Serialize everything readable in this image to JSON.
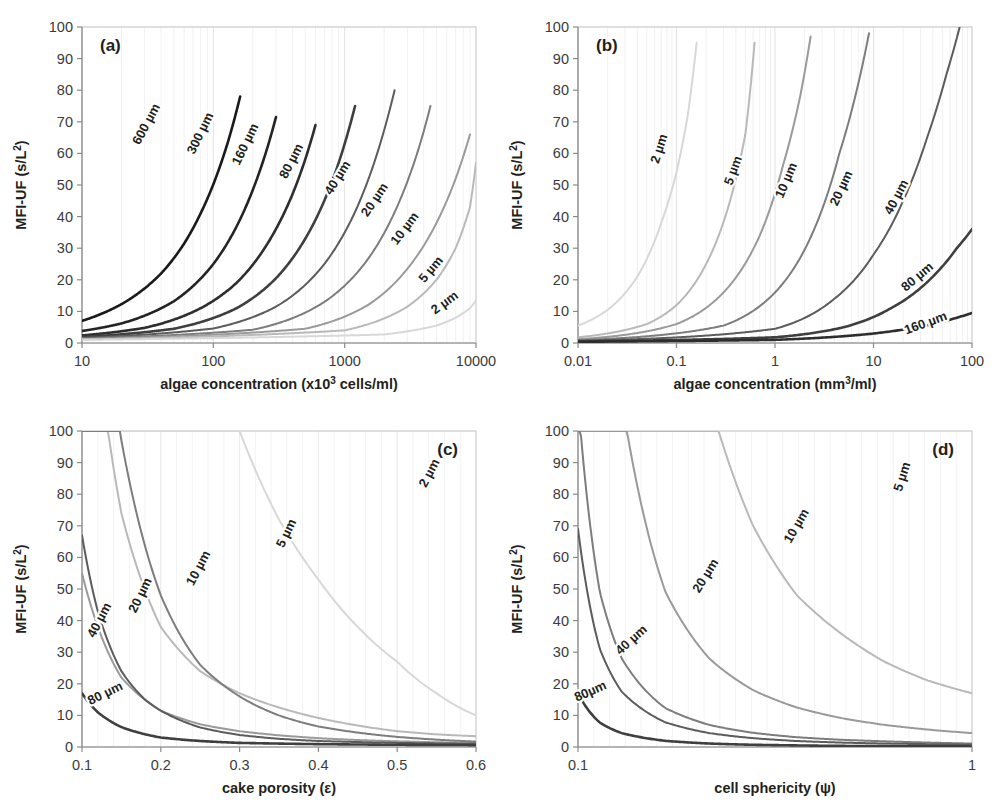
{
  "figure": {
    "background": "#ffffff",
    "panel_count": 4,
    "shared_ylabel": "MFI-UF (s/L²)",
    "shared_ylim": [
      0,
      100
    ],
    "shared_yticks": [
      0,
      10,
      20,
      30,
      40,
      50,
      60,
      70,
      80,
      90,
      100
    ],
    "curve_palette": {
      "600": "#1a1a1a",
      "300": "#242424",
      "160": "#2e2e2e",
      "80": "#3f3f3f",
      "40": "#5c5c5c",
      "20": "#7d7d7d",
      "10": "#9a9a9a",
      "5": "#b9b9b9",
      "2": "#d8d8d8"
    },
    "frame_color": "#b5b5b5",
    "gridline_color": "#ebebeb"
  },
  "chart_data": [
    {
      "type": "line",
      "panel": "a",
      "tag": "(a)",
      "tag_position": "top-left",
      "title": "",
      "xlabel": "algae concentration (x10³ cells/ml)",
      "xlabel_parts": {
        "pre": "algae concentration  (x10",
        "sup": "3",
        "post": " cells/ml)"
      },
      "ylabel": "MFI-UF (s/L²)",
      "xscale": "log",
      "xlim": [
        10,
        10000
      ],
      "ylim": [
        0,
        100
      ],
      "xticks": [
        10,
        100,
        1000,
        10000
      ],
      "xticklabels": [
        "10",
        "100",
        "1000",
        "10000"
      ],
      "yticks": [
        0,
        10,
        20,
        30,
        40,
        50,
        60,
        70,
        80,
        90,
        100
      ],
      "grid": "minor-vertical-log",
      "legend": "inline-curve-labels",
      "series": [
        {
          "name": "600 µm",
          "label": "600 µm",
          "color": "#1a1a1a",
          "x": [
            10,
            20,
            40,
            60,
            80,
            100,
            130,
            160
          ],
          "values": [
            7.0,
            12.3,
            22.0,
            31.5,
            41.0,
            50.2,
            64.0,
            78.0
          ]
        },
        {
          "name": "300 µm",
          "label": "300 µm",
          "color": "#242424",
          "x": [
            10,
            20,
            50,
            100,
            150,
            200,
            250,
            300
          ],
          "values": [
            3.8,
            6.2,
            13.2,
            25.0,
            36.8,
            48.5,
            60.0,
            71.5
          ]
        },
        {
          "name": "160 µm",
          "label": "160 µm",
          "color": "#2e2e2e",
          "x": [
            10,
            30,
            80,
            150,
            250,
            400,
            500,
            600
          ],
          "values": [
            2.4,
            4.8,
            11.0,
            19.0,
            30.5,
            47.0,
            58.0,
            69.0
          ]
        },
        {
          "name": "80 µm",
          "label": "80 µm",
          "color": "#3f3f3f",
          "x": [
            10,
            50,
            150,
            300,
            600,
            900,
            1200
          ],
          "values": [
            1.9,
            4.5,
            11.0,
            20.5,
            39.0,
            57.0,
            75.0
          ]
        },
        {
          "name": "40 µm",
          "label": "40 µm",
          "color": "#5c5c5c",
          "x": [
            10,
            100,
            300,
            700,
            1200,
            1800,
            2400
          ],
          "values": [
            1.6,
            4.6,
            11.5,
            25.0,
            41.5,
            61.0,
            80.0
          ]
        },
        {
          "name": "20 µm",
          "label": "20 µm",
          "color": "#7d7d7d",
          "x": [
            10,
            200,
            700,
            1500,
            2500,
            3500,
            4500
          ],
          "values": [
            1.4,
            4.2,
            13.0,
            26.5,
            43.0,
            59.0,
            75.0
          ]
        },
        {
          "name": "10 µm",
          "label": "10 µm",
          "color": "#9a9a9a",
          "x": [
            10,
            500,
            1500,
            3000,
            5000,
            7000,
            9000
          ],
          "values": [
            1.2,
            4.5,
            12.0,
            23.5,
            38.0,
            52.0,
            66.0
          ]
        },
        {
          "name": "5 µm",
          "label": "5 µm",
          "color": "#b9b9b9",
          "x": [
            10,
            1000,
            3000,
            5000,
            7000,
            9000,
            10000
          ],
          "values": [
            1.1,
            4.0,
            11.5,
            20.0,
            30.0,
            43.0,
            57.0
          ]
        },
        {
          "name": "2 µm",
          "label": "2 µm",
          "color": "#d8d8d8",
          "x": [
            10,
            2000,
            5000,
            7000,
            9000,
            10000
          ],
          "values": [
            1.0,
            2.7,
            5.5,
            8.0,
            11.0,
            13.5
          ]
        }
      ]
    },
    {
      "type": "line",
      "panel": "b",
      "tag": "(b)",
      "tag_position": "top-left",
      "title": "",
      "xlabel": "algae concentration (mm³/ml)",
      "xlabel_parts": {
        "pre": "algae concentration  (mm",
        "sup": "3",
        "post": "/ml)"
      },
      "ylabel": "MFI-UF (s/L²)",
      "xscale": "log",
      "xlim": [
        0.01,
        100
      ],
      "ylim": [
        0,
        100
      ],
      "xticks": [
        0.01,
        0.1,
        1,
        10,
        100
      ],
      "xticklabels": [
        "0.01",
        "0.1",
        "1",
        "10",
        "100"
      ],
      "yticks": [
        0,
        10,
        20,
        30,
        40,
        50,
        60,
        70,
        80,
        90,
        100
      ],
      "grid": "minor-vertical-log",
      "legend": "inline-curve-labels",
      "series": [
        {
          "name": "2 µm",
          "label": "2 µm",
          "color": "#d8d8d8",
          "x": [
            0.01,
            0.02,
            0.04,
            0.07,
            0.1,
            0.13,
            0.16
          ],
          "values": [
            5.5,
            10.5,
            21.0,
            38.0,
            54.0,
            72.0,
            95.0
          ]
        },
        {
          "name": "5 µm",
          "label": "5 µm",
          "color": "#b9b9b9",
          "x": [
            0.01,
            0.05,
            0.1,
            0.2,
            0.35,
            0.5,
            0.62
          ],
          "values": [
            1.8,
            6.0,
            12.0,
            25.0,
            45.0,
            66.0,
            95.0
          ]
        },
        {
          "name": "10 µm",
          "label": "10 µm",
          "color": "#9a9a9a",
          "x": [
            0.01,
            0.1,
            0.3,
            0.7,
            1.2,
            1.8,
            2.3
          ],
          "values": [
            1.2,
            6.0,
            16.0,
            34.0,
            56.0,
            78.0,
            97.0
          ]
        },
        {
          "name": "20 µm",
          "label": "20 µm",
          "color": "#7d7d7d",
          "x": [
            0.01,
            0.3,
            1.0,
            2.5,
            4.5,
            7.0,
            9.0
          ],
          "values": [
            0.9,
            5.5,
            16.0,
            36.0,
            60.0,
            82.0,
            98.0
          ]
        },
        {
          "name": "40 µm",
          "label": "40 µm",
          "color": "#5c5c5c",
          "x": [
            0.01,
            1.0,
            4.0,
            10.0,
            20.0,
            35.0,
            55.0,
            75.0
          ],
          "values": [
            0.7,
            4.5,
            14.0,
            28.0,
            45.0,
            65.0,
            85.0,
            100.0
          ]
        },
        {
          "name": "80 µm",
          "label": "80 µm",
          "color": "#3f3f3f",
          "x": [
            0.01,
            1.0,
            5.0,
            15.0,
            40.0,
            70.0,
            100.0
          ],
          "values": [
            0.5,
            1.8,
            5.0,
            11.0,
            21.0,
            30.0,
            36.0
          ]
        },
        {
          "name": "160 µm",
          "label": "160 µm",
          "color": "#2e2e2e",
          "x": [
            0.01,
            1.0,
            10.0,
            40.0,
            70.0,
            100.0
          ],
          "values": [
            0.4,
            1.0,
            3.0,
            6.0,
            8.0,
            9.5
          ]
        }
      ]
    },
    {
      "type": "line",
      "panel": "c",
      "tag": "(c)",
      "tag_position": "top-right",
      "title": "",
      "xlabel": "cake porosity (ε)",
      "ylabel": "MFI-UF (s/L²)",
      "xscale": "linear",
      "xlim": [
        0.1,
        0.6
      ],
      "ylim": [
        0,
        100
      ],
      "xticks": [
        0.1,
        0.2,
        0.3,
        0.4,
        0.5,
        0.6
      ],
      "xticklabels": [
        "0.1",
        "0.2",
        "0.3",
        "0.4",
        "0.5",
        "0.6"
      ],
      "yticks": [
        0,
        10,
        20,
        30,
        40,
        50,
        60,
        70,
        80,
        90,
        100
      ],
      "grid": "minor-vertical",
      "legend": "inline-curve-labels",
      "series": [
        {
          "name": "2 µm",
          "label": "2 µm",
          "color": "#d8d8d8",
          "x": [
            0.1,
            0.15,
            0.2,
            0.25,
            0.3,
            0.35,
            0.4,
            0.45,
            0.5,
            0.55,
            0.6
          ],
          "values": [
            1100,
            430,
            215,
            145,
            100,
            72,
            53,
            38,
            27,
            17,
            10
          ]
        },
        {
          "name": "5 µm",
          "label": "5 µm",
          "color": "#b9b9b9",
          "x": [
            0.1,
            0.15,
            0.2,
            0.25,
            0.3,
            0.35,
            0.4,
            0.45,
            0.5,
            0.55,
            0.6
          ],
          "values": [
            180,
            74,
            38,
            24,
            17,
            12.5,
            9.2,
            6.8,
            5.0,
            4.0,
            3.4
          ]
        },
        {
          "name": "10 µm",
          "label": "10 µm",
          "color": "#9a9a9a",
          "x": [
            0.1,
            0.15,
            0.2,
            0.25,
            0.3,
            0.35,
            0.4,
            0.45,
            0.5,
            0.55,
            0.6
          ],
          "values": [
            55,
            22,
            11.5,
            7.2,
            5.0,
            3.7,
            2.8,
            2.2,
            1.8,
            1.5,
            1.3
          ]
        },
        {
          "name": "20 µm",
          "label": "20 µm",
          "color": "#7d7d7d",
          "x": [
            0.1,
            0.12,
            0.15,
            0.2,
            0.25,
            0.3,
            0.35,
            0.4,
            0.5,
            0.6
          ],
          "values": [
            270,
            175,
            97,
            48,
            26,
            16,
            10,
            6.5,
            3.2,
            1.7
          ]
        },
        {
          "name": "40 µm",
          "label": "40 µm",
          "color": "#5c5c5c",
          "x": [
            0.1,
            0.12,
            0.15,
            0.18,
            0.2,
            0.25,
            0.3,
            0.35,
            0.4,
            0.5,
            0.6
          ],
          "values": [
            67,
            43,
            24,
            15,
            11.5,
            6.2,
            3.8,
            2.6,
            1.9,
            1.3,
            1.0
          ]
        },
        {
          "name": "80 µm",
          "label": "80 µm",
          "color": "#3f3f3f",
          "x": [
            0.1,
            0.12,
            0.15,
            0.2,
            0.25,
            0.3,
            0.4,
            0.5,
            0.6
          ],
          "values": [
            17,
            11,
            6.3,
            3.0,
            1.9,
            1.3,
            0.9,
            0.7,
            0.6
          ]
        }
      ]
    },
    {
      "type": "line",
      "panel": "d",
      "tag": "(d)",
      "tag_position": "top-right",
      "title": "",
      "xlabel": "cell sphericity (ψ)",
      "ylabel": "MFI-UF (s/L²)",
      "xscale": "linear",
      "xlim": [
        0.1,
        1
      ],
      "ylim": [
        0,
        100
      ],
      "xticks": [
        0.1,
        1
      ],
      "xticklabels": [
        "0.1",
        "1"
      ],
      "yticks": [
        0,
        10,
        20,
        30,
        40,
        50,
        60,
        70,
        80,
        90,
        100
      ],
      "grid": "minor-vertical",
      "legend": "inline-curve-labels",
      "series": [
        {
          "name": "5 µm",
          "label": "5 µm",
          "color": "#b9b9b9",
          "x": [
            0.1,
            0.2,
            0.3,
            0.4,
            0.5,
            0.6,
            0.7,
            0.8,
            0.9,
            1.0
          ],
          "values": [
            1750,
            430,
            195,
            110,
            70,
            48,
            36,
            27,
            21,
            17
          ]
        },
        {
          "name": "10 µm",
          "label": "10 µm",
          "color": "#9a9a9a",
          "x": [
            0.1,
            0.2,
            0.3,
            0.4,
            0.5,
            0.6,
            0.7,
            0.8,
            0.9,
            1.0
          ],
          "values": [
            440,
            110,
            49,
            28,
            18,
            12.5,
            9.2,
            7.0,
            5.5,
            4.4
          ]
        },
        {
          "name": "20 µm",
          "label": "20 µm",
          "color": "#7d7d7d",
          "x": [
            0.1,
            0.15,
            0.2,
            0.3,
            0.4,
            0.5,
            0.6,
            0.7,
            0.8,
            0.9,
            1.0
          ],
          "values": [
            110,
            49,
            28,
            12.3,
            7.0,
            4.5,
            3.1,
            2.3,
            1.8,
            1.4,
            1.1
          ]
        },
        {
          "name": "40 µm",
          "label": "40 µm",
          "color": "#5c5c5c",
          "x": [
            0.1,
            0.15,
            0.2,
            0.3,
            0.4,
            0.5,
            0.6,
            0.7,
            0.8,
            0.9,
            1.0
          ],
          "values": [
            69,
            31,
            17.5,
            7.8,
            4.4,
            2.8,
            1.9,
            1.4,
            1.1,
            0.9,
            0.7
          ]
        },
        {
          "name": "80 µm",
          "label": "80 µm",
          "color": "#3f3f3f",
          "x": [
            0.1,
            0.15,
            0.2,
            0.3,
            0.4,
            0.5,
            0.6,
            0.7,
            0.8,
            0.9,
            1.0
          ],
          "values": [
            17,
            7.7,
            4.4,
            1.95,
            1.1,
            0.7,
            0.5,
            0.35,
            0.27,
            0.22,
            0.18
          ]
        }
      ]
    }
  ],
  "labels": {
    "panel_a": {
      "curve_label_positions": [
        {
          "text": "600 µm",
          "x": 150,
          "y": 126,
          "rot": -62
        },
        {
          "text": "300 µm",
          "x": 204,
          "y": 135,
          "rot": -64
        },
        {
          "text": "160 µm",
          "x": 249,
          "y": 146,
          "rot": -64
        },
        {
          "text": "80 µm",
          "x": 295,
          "y": 163,
          "rot": -63
        },
        {
          "text": "40 µm",
          "x": 341,
          "y": 180,
          "rot": -58
        },
        {
          "text": "20 µm",
          "x": 378,
          "y": 202,
          "rot": -56
        },
        {
          "text": "10 µm",
          "x": 408,
          "y": 231,
          "rot": -53
        },
        {
          "text": "5 µm",
          "x": 434,
          "y": 272,
          "rot": -50
        },
        {
          "text": "2 µm",
          "x": 447,
          "y": 306,
          "rot": -36
        }
      ]
    },
    "panel_b": {
      "curve_label_positions": [
        {
          "text": "2 µm",
          "x": 663,
          "y": 150,
          "rot": -72
        },
        {
          "text": "5 µm",
          "x": 737,
          "y": 172,
          "rot": -70
        },
        {
          "text": "10 µm",
          "x": 790,
          "y": 182,
          "rot": -67
        },
        {
          "text": "20 µm",
          "x": 845,
          "y": 190,
          "rot": -65
        },
        {
          "text": "40 µm",
          "x": 900,
          "y": 199,
          "rot": -62
        },
        {
          "text": "80 µm",
          "x": 920,
          "y": 280,
          "rot": -40
        },
        {
          "text": "160 µm",
          "x": 927,
          "y": 327,
          "rot": -20
        }
      ]
    },
    "panel_c": {
      "curve_label_positions": [
        {
          "text": "2 µm",
          "x": 433,
          "y": 475,
          "rot": -62
        },
        {
          "text": "5 µm",
          "x": 290,
          "y": 535,
          "rot": -64
        },
        {
          "text": "10 µm",
          "x": 202,
          "y": 570,
          "rot": -62
        },
        {
          "text": "20 µm",
          "x": 144,
          "y": 597,
          "rot": -64
        },
        {
          "text": "40 µm",
          "x": 103,
          "y": 622,
          "rot": -62
        },
        {
          "text": "80 µm",
          "x": 107,
          "y": 697,
          "rot": -26
        }
      ]
    },
    "panel_d": {
      "curve_label_positions": [
        {
          "text": "5 µm",
          "x": 906,
          "y": 478,
          "rot": -72
        },
        {
          "text": "10 µm",
          "x": 800,
          "y": 528,
          "rot": -60
        },
        {
          "text": "20 µm",
          "x": 709,
          "y": 578,
          "rot": -58
        },
        {
          "text": "40 µm",
          "x": 634,
          "y": 643,
          "rot": -42
        },
        {
          "text": "80µm",
          "x": 592,
          "y": 695,
          "rot": -24
        }
      ]
    }
  }
}
